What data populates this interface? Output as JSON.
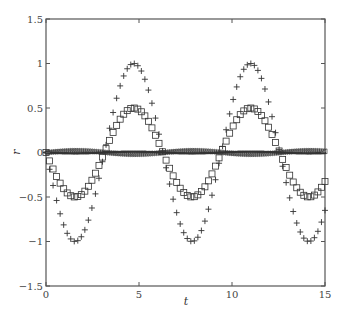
{
  "chart_data": {
    "type": "scatter",
    "title": "",
    "xlabel": "t",
    "ylabel": "r",
    "xlim": [
      0,
      15
    ],
    "ylim": [
      -1.5,
      1.5
    ],
    "xticks": [
      0,
      5,
      10,
      15
    ],
    "xtick_labels": [
      "0",
      "5",
      "10",
      "15"
    ],
    "yticks": [
      -1.5,
      -1,
      -0.5,
      0,
      0.5,
      1,
      1.5
    ],
    "ytick_labels": [
      "−1.5",
      "−1",
      "−0.5",
      "0",
      "0.5",
      "1",
      "1.5"
    ],
    "grid": false,
    "legend": null,
    "series": [
      {
        "name": "plus-series",
        "marker": "+",
        "description": "-1.0*sin(t), amplitude 1",
        "amplitude": -1.0,
        "x_start": 0,
        "x_end": 15,
        "n_points": 80
      },
      {
        "name": "square-series",
        "marker": "square",
        "description": "-0.5*sin(t), amplitude 0.5",
        "amplitude": -0.5,
        "x_start": 0,
        "x_end": 15,
        "n_points": 80
      },
      {
        "name": "triangle-series",
        "marker": "triangle",
        "description": "near-zero response, approx 0.02*sin(t)",
        "amplitude": 0.02,
        "x_start": 0,
        "x_end": 15,
        "n_points": 150
      },
      {
        "name": "dense-near-zero-series",
        "marker": "dot",
        "description": "dense curve hugging zero",
        "amplitude": -0.01,
        "x_start": 0,
        "x_end": 15,
        "n_points": 200
      }
    ]
  },
  "colors": {
    "axis": "#555555",
    "marker": "#333333",
    "background": "#ffffff"
  }
}
